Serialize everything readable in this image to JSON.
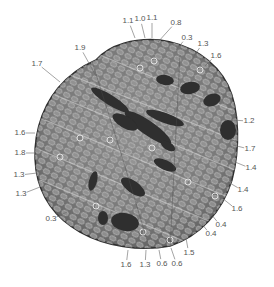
{
  "figure": {
    "colors": {
      "background": "#ffffff",
      "specimen_dark": "#3a3a3a",
      "specimen_mid": "#7a7a7a",
      "specimen_light": "#b5b5b5",
      "label": "#555555",
      "leader": "#666666"
    }
  },
  "annotations": [
    {
      "text": "1.9",
      "x": 80,
      "y": 48,
      "tx": 96,
      "ty": 76
    },
    {
      "text": "1.7",
      "x": 37,
      "y": 64,
      "tx": 60,
      "ty": 82
    },
    {
      "text": "1.1",
      "x": 128,
      "y": 21,
      "tx": 135,
      "ty": 38
    },
    {
      "text": "1.0",
      "x": 140,
      "y": 19,
      "tx": 145,
      "ty": 38
    },
    {
      "text": "1.1",
      "x": 152,
      "y": 18,
      "tx": 152,
      "ty": 38
    },
    {
      "text": "0.8",
      "x": 176,
      "y": 23,
      "tx": 158,
      "ty": 42
    },
    {
      "text": "0.3",
      "x": 187,
      "y": 38,
      "tx": 176,
      "ty": 50
    },
    {
      "text": "1.3",
      "x": 203,
      "y": 44,
      "tx": 190,
      "ty": 62
    },
    {
      "text": "1.6",
      "x": 216,
      "y": 56,
      "tx": 205,
      "ty": 66
    },
    {
      "text": "1.2",
      "x": 249,
      "y": 121,
      "tx": 232,
      "ty": 120
    },
    {
      "text": "1.7",
      "x": 250,
      "y": 149,
      "tx": 233,
      "ty": 145
    },
    {
      "text": "1.4",
      "x": 251,
      "y": 168,
      "tx": 235,
      "ty": 162
    },
    {
      "text": "1.4",
      "x": 243,
      "y": 190,
      "tx": 228,
      "ty": 182
    },
    {
      "text": "1.6",
      "x": 237,
      "y": 209,
      "tx": 222,
      "ty": 198
    },
    {
      "text": "0.4",
      "x": 221,
      "y": 225,
      "tx": 211,
      "ty": 214
    },
    {
      "text": "0.4",
      "x": 211,
      "y": 234,
      "tx": 202,
      "ty": 224
    },
    {
      "text": "1.5",
      "x": 189,
      "y": 253,
      "tx": 186,
      "ty": 238
    },
    {
      "text": "0.6",
      "x": 177,
      "y": 264,
      "tx": 171,
      "ty": 248
    },
    {
      "text": "0.6",
      "x": 162,
      "y": 264,
      "tx": 159,
      "ty": 250
    },
    {
      "text": "1.3",
      "x": 145,
      "y": 265,
      "tx": 146,
      "ty": 250
    },
    {
      "text": "1.6",
      "x": 126,
      "y": 265,
      "tx": 128,
      "ty": 250
    },
    {
      "text": "0.3",
      "x": 51,
      "y": 219,
      "tx": 67,
      "ty": 212
    },
    {
      "text": "1.3",
      "x": 21,
      "y": 194,
      "tx": 40,
      "ty": 187
    },
    {
      "text": "1.3",
      "x": 19,
      "y": 175,
      "tx": 37,
      "ty": 173
    },
    {
      "text": "1.8",
      "x": 20,
      "y": 153,
      "tx": 34,
      "ty": 153
    },
    {
      "text": "1.6",
      "x": 20,
      "y": 133,
      "tx": 35,
      "ty": 133
    }
  ]
}
